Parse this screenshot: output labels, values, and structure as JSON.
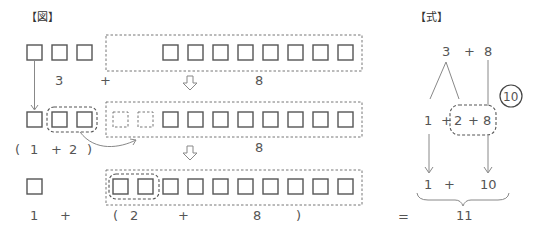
{
  "figure": {
    "header": "【図】",
    "row1": {
      "left_box_count": 3,
      "right_box_count": 8,
      "labels": {
        "left": "3",
        "op": "+",
        "right": "8"
      }
    },
    "row2": {
      "moved_box_count": 1,
      "grouped_box_count": 2,
      "ghost_box_count": 2,
      "right_box_count": 7,
      "labels": {
        "open": "(",
        "a": "1",
        "op": "+",
        "b": "2",
        "close": ")",
        "right": "8"
      }
    },
    "row3": {
      "left_box_count": 1,
      "right_box_count": 10,
      "grouped_box_count": 2,
      "labels": {
        "a": "1",
        "op1": "+",
        "open": "(",
        "b": "2",
        "op2": "+",
        "c": "8",
        "close": ")"
      }
    }
  },
  "formula": {
    "header": "【式】",
    "line1": {
      "a": "3",
      "op": "+",
      "b": "8"
    },
    "decomposition_badge": "10",
    "line2": {
      "a": "1",
      "op1": "+",
      "b": "2",
      "op2": "+",
      "c": "8"
    },
    "line3": {
      "a": "1",
      "op": "+",
      "b": "10"
    },
    "equals": "=",
    "result": "11"
  }
}
